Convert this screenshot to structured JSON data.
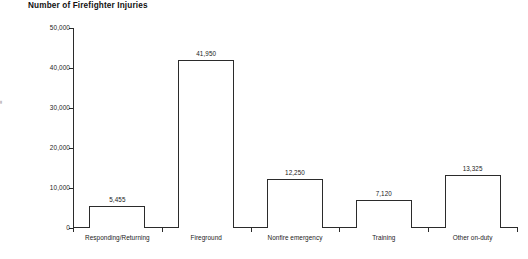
{
  "chart_data": {
    "type": "bar",
    "title": "Number of Firefighter Injuries",
    "xlabel": "",
    "ylabel": "",
    "categories": [
      "Responding/Returning",
      "Fireground",
      "Nonfire emergency",
      "Training",
      "Other on-duty"
    ],
    "values": [
      5455,
      41950,
      12250,
      7120,
      13325
    ],
    "value_labels": [
      "5,455",
      "41,950",
      "12,250",
      "7,120",
      "13,325"
    ],
    "ylim": [
      0,
      50000
    ],
    "yticks": [
      0,
      10000,
      20000,
      30000,
      40000,
      50000
    ],
    "ytick_labels": [
      "0",
      "10,000",
      "20,000",
      "30,000",
      "40,000",
      "50,000"
    ],
    "grid": false,
    "legend": null,
    "bar_fill_color": "#ffffff",
    "bar_edge_color": "#2b2b2b",
    "axis_color": "#2b2b2b",
    "text_color": "#1a1a1a",
    "background_color": "#ffffff"
  },
  "axis_caption": "="
}
